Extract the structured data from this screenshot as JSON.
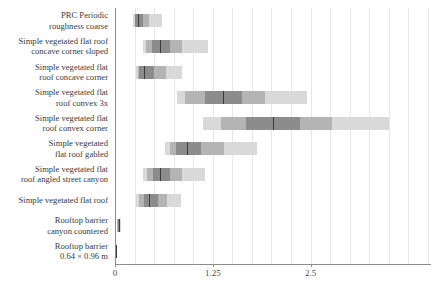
{
  "chart_data": {
    "type": "bar",
    "title": "",
    "subtitle": "",
    "xlabel": "",
    "ylabel": "",
    "grid": true,
    "legend": null,
    "orientation": "horizontal",
    "xlim": [
      0,
      4.05
    ],
    "xticks": [
      0,
      1.25,
      2.5
    ],
    "xticklabels": [
      "0",
      "1.25",
      "2.5"
    ],
    "axis_px": {
      "x0_px": 115,
      "px_per_unit": 78.2
    },
    "note": "Gradient density / credible-interval bands: outer = widest interval (lightest), inner = narrower intervals (darker), thin dark line = median",
    "categories": [
      "PRC Periodic roughness coarse",
      "Simple vegetated flat roof concave corner sloped",
      "Simple vegetated flat roof concave corner",
      "Simple vegetated flat roof convex 3x",
      "Simple vegetated flat roof convex corner",
      "Simple vegetated flat roof gabled",
      "Simple vegetated flat roof angled street canyon",
      "Simple vegetated flat roof",
      "Rooftop barrier canyon countered",
      "Rooftop barrier 0.64 × 0.96 m"
    ],
    "category_lines": [
      [
        "PRC Periodic",
        "roughness coarse"
      ],
      [
        "Simple vegetated flat roof",
        "concave corner sloped"
      ],
      [
        "Simple vegetated flat",
        "roof concave corner"
      ],
      [
        "Simple vegetated flat",
        "roof convex 3x"
      ],
      [
        "Simple vegetated flat",
        "roof convex corner"
      ],
      [
        "Simple vegetated",
        "flat roof gabled"
      ],
      [
        "Simple vegetated flat",
        "roof angled street canyon"
      ],
      [
        "Simple vegetated flat roof"
      ],
      [
        "Rooftop barrier",
        "canyon countered"
      ],
      [
        "Rooftop barrier",
        "0.64 × 0.96 m"
      ]
    ],
    "series": [
      {
        "name": "PRC Periodic roughness coarse",
        "median": 0.29,
        "intervals": [
          {
            "level": "outer",
            "low": 0.23,
            "high": 0.6
          },
          {
            "level": "mid",
            "low": 0.25,
            "high": 0.44
          },
          {
            "level": "inner",
            "low": 0.26,
            "high": 0.36
          }
        ]
      },
      {
        "name": "Simple vegetated flat roof concave corner sloped",
        "median": 0.57,
        "intervals": [
          {
            "level": "outer",
            "low": 0.36,
            "high": 1.19
          },
          {
            "level": "mid",
            "low": 0.4,
            "high": 0.86
          },
          {
            "level": "inner",
            "low": 0.47,
            "high": 0.7
          }
        ]
      },
      {
        "name": "Simple vegetated flat roof concave corner",
        "median": 0.37,
        "intervals": [
          {
            "level": "outer",
            "low": 0.27,
            "high": 0.86
          },
          {
            "level": "mid",
            "low": 0.29,
            "high": 0.65
          },
          {
            "level": "inner",
            "low": 0.31,
            "high": 0.5
          }
        ]
      },
      {
        "name": "Simple vegetated flat roof convex 3x",
        "median": 1.38,
        "intervals": [
          {
            "level": "outer",
            "low": 0.79,
            "high": 2.45
          },
          {
            "level": "mid",
            "low": 0.9,
            "high": 1.92
          },
          {
            "level": "inner",
            "low": 1.15,
            "high": 1.62
          }
        ]
      },
      {
        "name": "Simple vegetated flat roof convex corner",
        "median": 2.02,
        "intervals": [
          {
            "level": "outer",
            "low": 1.12,
            "high": 3.5
          },
          {
            "level": "mid",
            "low": 1.36,
            "high": 2.78
          },
          {
            "level": "inner",
            "low": 1.68,
            "high": 2.36
          }
        ]
      },
      {
        "name": "Simple vegetated flat roof gabled",
        "median": 0.92,
        "intervals": [
          {
            "level": "outer",
            "low": 0.64,
            "high": 1.82
          },
          {
            "level": "mid",
            "low": 0.7,
            "high": 1.4
          },
          {
            "level": "inner",
            "low": 0.78,
            "high": 1.1
          }
        ]
      },
      {
        "name": "Simple vegetated flat roof angled street canyon",
        "median": 0.58,
        "intervals": [
          {
            "level": "outer",
            "low": 0.36,
            "high": 1.15
          },
          {
            "level": "mid",
            "low": 0.41,
            "high": 0.86
          },
          {
            "level": "inner",
            "low": 0.48,
            "high": 0.7
          }
        ]
      },
      {
        "name": "Simple vegetated flat roof",
        "median": 0.44,
        "intervals": [
          {
            "level": "outer",
            "low": 0.27,
            "high": 0.84
          },
          {
            "level": "mid",
            "low": 0.31,
            "high": 0.66
          },
          {
            "level": "inner",
            "low": 0.37,
            "high": 0.55
          }
        ]
      },
      {
        "name": "Rooftop barrier canyon countered",
        "median": 0.05,
        "intervals": [
          {
            "level": "outer",
            "low": 0.02,
            "high": 0.08
          },
          {
            "level": "mid",
            "low": 0.03,
            "high": 0.07
          },
          {
            "level": "inner",
            "low": 0.04,
            "high": 0.06
          }
        ]
      },
      {
        "name": "Rooftop barrier 0.64 × 0.96 m",
        "median": 0.015,
        "intervals": [
          {
            "level": "outer",
            "low": 0.004,
            "high": 0.028
          },
          {
            "level": "mid",
            "low": 0.008,
            "high": 0.023
          },
          {
            "level": "inner",
            "low": 0.011,
            "high": 0.019
          }
        ]
      }
    ]
  },
  "colors": {
    "band_outer": "#d9d9d9",
    "band_mid": "#b4b4b4",
    "band_inner": "#8c8c8c",
    "median": "#2b2b2b",
    "axis": "#8d8d8d",
    "grid": "#e6e6e6",
    "text": "#3a3a3a",
    "background": "#ffffff"
  }
}
